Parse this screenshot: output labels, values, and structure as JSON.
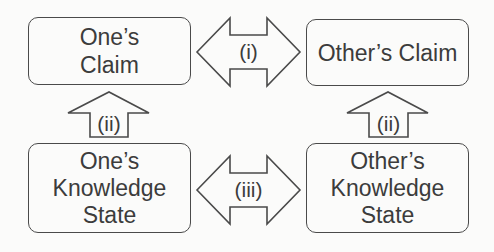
{
  "nodes": {
    "ones_claim": "One’s\nClaim",
    "others_claim": "Other’s Claim",
    "ones_knowledge": "One’s\nKnowledge\nState",
    "others_knowledge": "Other’s\nKnowledge\nState"
  },
  "arrows": {
    "claim_exchange": "(i)",
    "left_up": "(ii)",
    "right_up": "(ii)",
    "knowledge_exchange": "(iii)"
  },
  "colors": {
    "stroke": "#4a4a4a",
    "text": "#3c3c3c",
    "background": "#fbfbfa"
  }
}
